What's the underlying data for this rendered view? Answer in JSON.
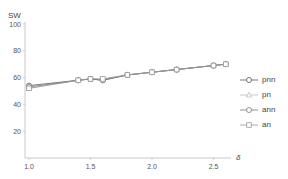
{
  "chart_data": {
    "type": "line",
    "title": "",
    "xlabel": "δ",
    "ylabel": "SW",
    "xlim": [
      1.0,
      2.65
    ],
    "ylim": [
      0,
      100
    ],
    "xticks": [
      "1.0",
      "1.5",
      "2.0",
      "2.5"
    ],
    "yticks": [
      "20",
      "40",
      "60",
      "80",
      "100"
    ],
    "grid": false,
    "legend_position": "right",
    "x": [
      1.0,
      1.4,
      1.5,
      1.6,
      1.8,
      2.0,
      2.2,
      2.5,
      2.6
    ],
    "series": [
      {
        "name": "pnn",
        "marker": "circle",
        "color": "#555555",
        "values": [
          54,
          58,
          59,
          58,
          62,
          64,
          66,
          69,
          70
        ]
      },
      {
        "name": "pn",
        "marker": "triangle",
        "color": "#bbbbbb",
        "values": [
          52,
          58,
          59,
          59,
          62,
          64,
          66,
          69,
          70
        ]
      },
      {
        "name": "ann",
        "marker": "circle",
        "color": "#777777",
        "values": [
          53,
          58,
          59,
          58,
          62,
          64,
          66,
          69,
          70
        ]
      },
      {
        "name": "an",
        "marker": "square",
        "color": "#999999",
        "values": [
          52,
          58,
          59,
          59,
          62,
          64,
          66,
          69,
          70
        ]
      }
    ]
  }
}
